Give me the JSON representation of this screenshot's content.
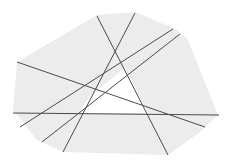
{
  "diagram": {
    "type": "line-arrangement-in-convex-polygon",
    "width": 229,
    "height": 162,
    "colors": {
      "background": "#ffffff",
      "polygon_fill": "#ececec",
      "free_region_fill": "#ffffff",
      "line_stroke": "#4a4a4a"
    },
    "polygon": [
      [
        97,
        15
      ],
      [
        135,
        12
      ],
      [
        173,
        28
      ],
      [
        187,
        38
      ],
      [
        218,
        115
      ],
      [
        200,
        132
      ],
      [
        168,
        155
      ],
      [
        63,
        152
      ],
      [
        37,
        140
      ],
      [
        13,
        110
      ],
      [
        17,
        62
      ]
    ],
    "free_region": [
      [
        125,
        68
      ],
      [
        148,
        113
      ],
      [
        79,
        113
      ],
      [
        90,
        96
      ],
      [
        100,
        88
      ]
    ],
    "lines": [
      {
        "id": "line-1",
        "x1": 97,
        "y1": 16,
        "x2": 168,
        "y2": 155
      },
      {
        "id": "line-2",
        "x1": 135,
        "y1": 13,
        "x2": 63,
        "y2": 152
      },
      {
        "id": "line-3",
        "x1": 173,
        "y1": 29,
        "x2": 20,
        "y2": 127
      },
      {
        "id": "line-4",
        "x1": 180,
        "y1": 34,
        "x2": 42,
        "y2": 142
      },
      {
        "id": "line-5",
        "x1": 17,
        "y1": 62,
        "x2": 205,
        "y2": 127
      },
      {
        "id": "line-6",
        "x1": 13,
        "y1": 113,
        "x2": 219,
        "y2": 115
      }
    ]
  }
}
